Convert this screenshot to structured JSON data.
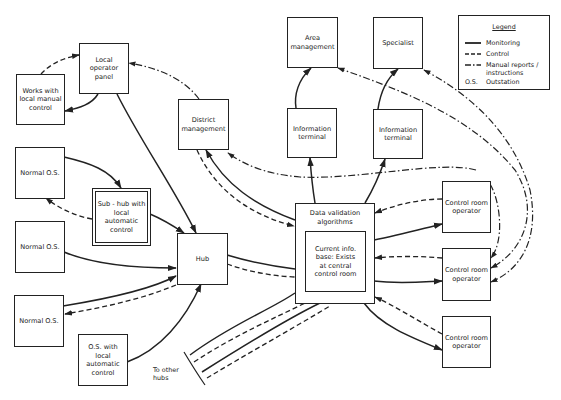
{
  "diagram": {
    "nodes": {
      "local_operator_panel": "Local\noperator\npanel",
      "works_local_manual": "Works with\nlocal manual\ncontrol",
      "district_management": "District\nmanagement",
      "area_management": "Area\nmanagement",
      "specialist": "Specialist",
      "info_terminal_1": "Information\nterminal",
      "info_terminal_2": "Information\nterminal",
      "normal_os_1": "Normal O.S.",
      "normal_os_2": "Normal O.S.",
      "normal_os_3": "Normal O.S.",
      "sub_hub": "Sub - hub with\nlocal\nautomatic\ncontrol",
      "hub": "Hub",
      "os_local_auto": "O.S. with\nlocal\nautomatic\ncontrol",
      "data_validation": "Data validation\nalgorithms",
      "current_info_base": "Current info.\nbase: Exists\nat central\ncontrol room",
      "control_room_1": "Control room\noperator",
      "control_room_2": "Control room\noperator",
      "control_room_3": "Control room\noperator"
    },
    "notes": {
      "to_other_hubs": "To other\nhubs"
    },
    "legend": {
      "title": "Legend",
      "items": [
        {
          "style": "solid",
          "label": "Monitoring"
        },
        {
          "style": "dashed",
          "label": "Control"
        },
        {
          "style": "dash-dot",
          "label": "Manual reports /\ninstructions"
        },
        {
          "style": "abbr",
          "key": "O.S.",
          "label": "Outstation"
        }
      ]
    },
    "colors": {
      "line": "#222222",
      "background": "#ffffff"
    }
  }
}
